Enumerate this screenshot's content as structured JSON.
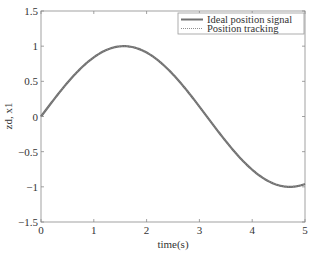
{
  "chart_data": {
    "type": "line",
    "title": "",
    "xlabel": "time(s)",
    "ylabel": "zd, x1",
    "xlim": [
      0,
      5
    ],
    "ylim": [
      -1.5,
      1.5
    ],
    "xticks": [
      0,
      1,
      2,
      3,
      4,
      5
    ],
    "xtick_labels": [
      "0",
      "1",
      "2",
      "3",
      "4",
      "5"
    ],
    "yticks": [
      -1.5,
      -1,
      -0.5,
      0,
      0.5,
      1,
      1.5
    ],
    "ytick_labels": [
      "−1.5",
      "−1",
      "−0.5",
      "0",
      "0.5",
      "1",
      "1.5"
    ],
    "grid": false,
    "legend_position": "upper right",
    "series": [
      {
        "name": "Ideal position signal",
        "style": "solid",
        "color": "#707070",
        "function": "sin(t)",
        "x": [
          0,
          0.5,
          1,
          1.5,
          1.5708,
          2,
          2.5,
          3,
          3.5,
          4,
          4.5,
          4.7124,
          5
        ],
        "values": [
          0,
          0.479,
          0.841,
          0.997,
          1.0,
          0.909,
          0.598,
          0.141,
          -0.351,
          -0.757,
          -0.978,
          -1.0,
          -0.959
        ]
      },
      {
        "name": "Position tracking",
        "style": "dotted",
        "color": "#909090",
        "function": "sin(t)",
        "x": [
          0,
          0.5,
          1,
          1.5,
          1.5708,
          2,
          2.5,
          3,
          3.5,
          4,
          4.5,
          4.7124,
          5
        ],
        "values": [
          0,
          0.479,
          0.841,
          0.997,
          1.0,
          0.909,
          0.598,
          0.141,
          -0.351,
          -0.757,
          -0.978,
          -1.0,
          -0.959
        ]
      }
    ]
  },
  "legend": {
    "items": [
      {
        "label": "Ideal position signal"
      },
      {
        "label": "Position tracking"
      }
    ]
  },
  "axes": {
    "xlabel": "time(s)",
    "ylabel": "zd, x1"
  }
}
